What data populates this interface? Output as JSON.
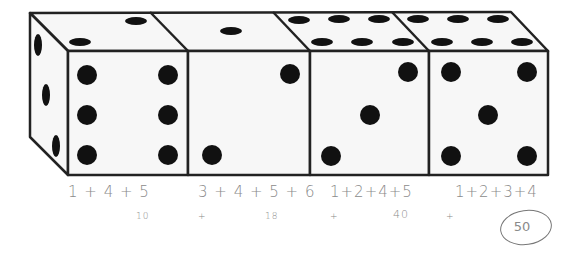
{
  "figure": {
    "dice": [
      {
        "index": 1,
        "front": 6,
        "top": 2,
        "side": 3
      },
      {
        "index": 2,
        "front": 2,
        "top": 1
      },
      {
        "index": 3,
        "front": 3,
        "top": 6
      },
      {
        "index": 4,
        "front": 5,
        "top": 6
      }
    ]
  },
  "annotations": {
    "expressions": [
      "1 + 4 + 5",
      "3 + 4 + 5 + 6",
      "1+2+4+5",
      "1+2+3+4"
    ],
    "values": [
      "10",
      "18",
      "40"
    ],
    "plus_marks": [
      "+",
      "+",
      "+"
    ],
    "answer": "50"
  },
  "colors": {
    "outline": "#222222",
    "pip": "#111111",
    "face": "#f7f7f7",
    "pencil": "#8a8a8a"
  }
}
